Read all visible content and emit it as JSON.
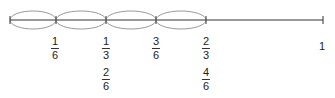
{
  "diagram": {
    "type": "number-line",
    "line": {
      "y": 20,
      "x_start": 10,
      "x_end": 323,
      "color": "#333333"
    },
    "arc_color": "#9a9a9a",
    "ticks": [
      {
        "x": 10,
        "value": "0"
      },
      {
        "x": 56,
        "value": "1/6"
      },
      {
        "x": 106,
        "value": "2/6"
      },
      {
        "x": 156,
        "value": "3/6"
      },
      {
        "x": 206,
        "value": "4/6"
      },
      {
        "x": 323,
        "value": "1"
      }
    ],
    "jumps": [
      {
        "from": 10,
        "to": 56
      },
      {
        "from": 56,
        "to": 106
      },
      {
        "from": 106,
        "to": 156
      },
      {
        "from": 156,
        "to": 206
      }
    ],
    "labels": {
      "one_sixth": {
        "num": "1",
        "den": "6"
      },
      "one_third": {
        "num": "1",
        "den": "3"
      },
      "two_sixths": {
        "num": "2",
        "den": "6"
      },
      "three_sixths": {
        "num": "3",
        "den": "6"
      },
      "two_thirds": {
        "num": "2",
        "den": "3"
      },
      "four_sixths": {
        "num": "4",
        "den": "6"
      },
      "one": "1"
    }
  }
}
